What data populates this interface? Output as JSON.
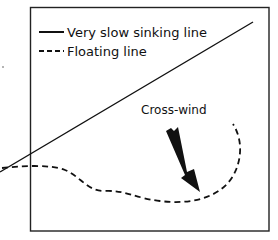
{
  "diagram": {
    "legend": {
      "items": [
        {
          "style": "solid",
          "label": "Very slow sinking line"
        },
        {
          "style": "dashed",
          "label": "Floating line"
        }
      ]
    },
    "annotation": {
      "label": "Cross-wind",
      "icon": "wind-arrow-icon"
    },
    "colors": {
      "ink": "#111111",
      "background": "#ffffff",
      "frame": "#222222"
    }
  }
}
